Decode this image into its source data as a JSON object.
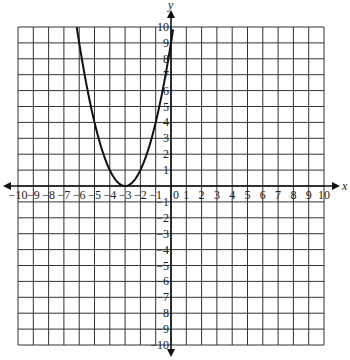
{
  "chart_data": {
    "type": "line",
    "title": "",
    "xlabel": "x",
    "ylabel": "y",
    "xlim": [
      -10,
      10
    ],
    "ylim": [
      -10,
      10
    ],
    "grid": true,
    "x_ticks": [
      -10,
      -9,
      -8,
      -7,
      -6,
      -5,
      -4,
      -3,
      -2,
      -1,
      0,
      1,
      2,
      3,
      4,
      5,
      6,
      7,
      8,
      9,
      10
    ],
    "y_ticks": [
      -10,
      -9,
      -8,
      -7,
      -6,
      -5,
      -4,
      -3,
      -2,
      -1,
      1,
      2,
      3,
      4,
      5,
      6,
      7,
      8,
      9,
      10
    ],
    "series": [
      {
        "name": "parabola",
        "equation": "y = (x + 3)^2",
        "vertex": [
          -3,
          0
        ],
        "x": [
          -6.16,
          -6,
          -5.5,
          -5,
          -4.5,
          -4,
          -3.5,
          -3,
          -2.5,
          -2,
          -1.5,
          -1,
          -0.5,
          0,
          0.16
        ],
        "y": [
          10,
          9,
          6.25,
          4,
          2.25,
          1,
          0.25,
          0,
          0.25,
          1,
          2.25,
          4,
          6.25,
          9,
          10
        ]
      }
    ],
    "colors": {
      "grid": "#333333",
      "curve": "#111111",
      "axes": "#111111"
    }
  }
}
